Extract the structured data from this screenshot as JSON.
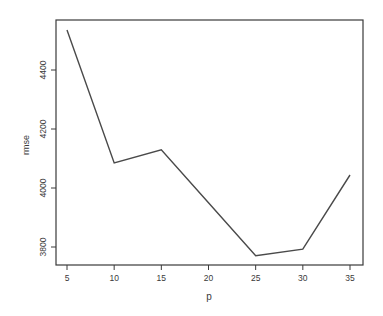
{
  "chart_data": {
    "type": "line",
    "title": "",
    "xlabel": "p",
    "ylabel": "rmse",
    "x": [
      5,
      10,
      15,
      20,
      25,
      30,
      35
    ],
    "series": [
      {
        "name": "rmse",
        "values": [
          4536,
          4085,
          4129,
          3950,
          3770,
          3793,
          4044
        ]
      }
    ],
    "xticks": [
      5,
      10,
      15,
      20,
      25,
      30,
      35
    ],
    "xtick_labels": [
      "5",
      "10",
      "15",
      "20",
      "25",
      "30",
      "35"
    ],
    "yticks": [
      3800,
      4000,
      4200,
      4400
    ],
    "ytick_labels": [
      "3800",
      "4000",
      "4200",
      "4400"
    ],
    "xlim": [
      4,
      36
    ],
    "ylim": [
      3740,
      4570
    ],
    "grid": false,
    "legend": null,
    "colors": {
      "line": "#4a4a4a",
      "axis": "#3a3a3a",
      "background": "#ffffff"
    }
  }
}
